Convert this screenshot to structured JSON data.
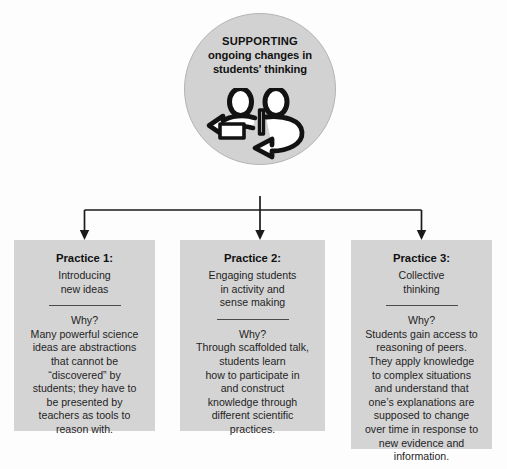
{
  "colors": {
    "node_fill": "#d2d2d2",
    "box_fill": "#d4d4d4",
    "connector": "#1a1a1a",
    "text": "#1b1b1b",
    "page_background": "#fdfdfd"
  },
  "root": {
    "title_line_1": "SUPPORTING",
    "title_line_2": "ongoing changes in",
    "title_line_3": "students' thinking",
    "icon": "two-people-dialogue-icon"
  },
  "practices": [
    {
      "title": "Practice 1:",
      "subtitle_lines": [
        "Introducing",
        "new ideas"
      ],
      "why_label": "Why?",
      "why_lines": [
        "Many powerful science",
        "ideas are abstractions",
        "that cannot be",
        "“discovered” by",
        "students; they have to",
        "be presented by",
        "teachers as tools to",
        "reason with."
      ]
    },
    {
      "title": "Practice 2:",
      "subtitle_lines": [
        "Engaging students",
        "in activity and",
        "sense making"
      ],
      "why_label": "Why?",
      "why_lines": [
        "Through scaffolded talk,",
        "students learn",
        "how to participate in",
        "and construct",
        "knowledge through",
        "different scientific",
        "practices."
      ]
    },
    {
      "title": "Practice 3:",
      "subtitle_lines": [
        "Collective",
        "thinking"
      ],
      "why_label": "Why?",
      "why_lines": [
        "Students gain access to",
        "reasoning of peers.",
        "They apply knowledge",
        "to complex situations",
        "and understand that",
        "one’s explanations are",
        "supposed to change",
        "over time in response to",
        "new evidence and",
        "information."
      ]
    }
  ]
}
